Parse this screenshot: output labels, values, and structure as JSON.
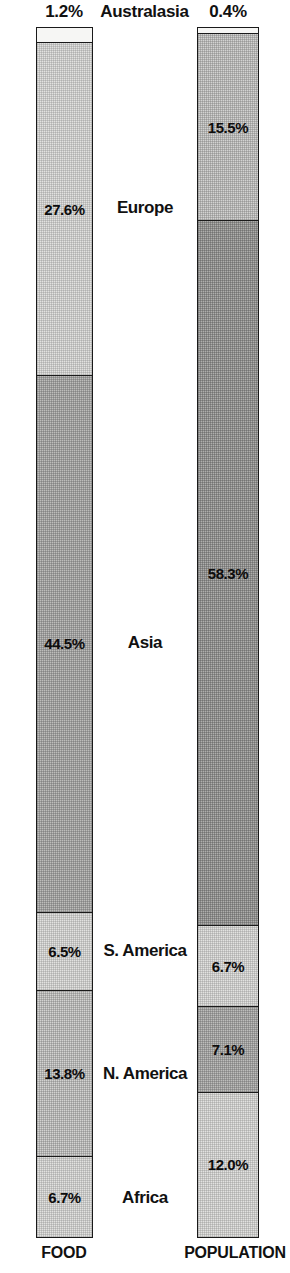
{
  "chart_data": {
    "type": "bar",
    "title": "",
    "subtitle": "",
    "xlabel": "",
    "ylabel": "",
    "ylim": [
      0,
      100
    ],
    "grid": false,
    "legend_position": "center-between-bars",
    "stacked": true,
    "orientation": "vertical",
    "categories": [
      "Australasia",
      "Europe",
      "Asia",
      "S. America",
      "N. America",
      "Africa"
    ],
    "series": [
      {
        "name": "FOOD",
        "values": [
          1.2,
          27.6,
          44.5,
          6.5,
          13.8,
          6.7
        ],
        "value_labels": [
          "1.2%",
          "27.6%",
          "44.5%",
          "6.5%",
          "13.8%",
          "6.7%"
        ]
      },
      {
        "name": "POPULATION",
        "values": [
          0.4,
          15.5,
          58.3,
          6.7,
          7.1,
          12.0
        ],
        "value_labels": [
          "0.4%",
          "15.5%",
          "58.3%",
          "6.7%",
          "7.1%",
          "12.0%"
        ]
      }
    ]
  },
  "header": {
    "top_category": "Australasia",
    "food_top_value": "1.2%",
    "population_top_value": "0.4%"
  },
  "axis": {
    "left_caption": "FOOD",
    "right_caption": "POPULATION"
  },
  "center_labels": [
    {
      "name": "Australasia"
    },
    {
      "name": "Europe"
    },
    {
      "name": "Asia"
    },
    {
      "name": "S. America"
    },
    {
      "name": "N. America"
    },
    {
      "name": "Africa"
    }
  ],
  "bars": {
    "food": {
      "caption": "FOOD",
      "segments": [
        {
          "category": "Australasia",
          "value": 1.2,
          "label": "1.2%",
          "tone": "fill-white"
        },
        {
          "category": "Europe",
          "value": 27.6,
          "label": "27.6%",
          "tone": "fill-lightest"
        },
        {
          "category": "Asia",
          "value": 44.5,
          "label": "44.5%",
          "tone": "fill-mid"
        },
        {
          "category": "S. America",
          "value": 6.5,
          "label": "6.5%",
          "tone": "fill-lightest"
        },
        {
          "category": "N. America",
          "value": 13.8,
          "label": "13.8%",
          "tone": "fill-light"
        },
        {
          "category": "Africa",
          "value": 6.7,
          "label": "6.7%",
          "tone": "fill-lightest"
        }
      ]
    },
    "population": {
      "caption": "POPULATION",
      "segments": [
        {
          "category": "Australasia",
          "value": 0.4,
          "label": "0.4%",
          "tone": "fill-white"
        },
        {
          "category": "Europe",
          "value": 15.5,
          "label": "15.5%",
          "tone": "fill-light"
        },
        {
          "category": "Asia",
          "value": 58.3,
          "label": "58.3%",
          "tone": "fill-dark"
        },
        {
          "category": "S. America",
          "value": 6.7,
          "label": "6.7%",
          "tone": "fill-lightest"
        },
        {
          "category": "N. America",
          "value": 7.1,
          "label": "7.1%",
          "tone": "fill-mid"
        },
        {
          "category": "Africa",
          "value": 12.0,
          "label": "12.0%",
          "tone": "fill-lightest"
        }
      ]
    }
  },
  "colors": {
    "outline": "#1a1a1a",
    "text": "#111111",
    "background": "#ffffff"
  }
}
